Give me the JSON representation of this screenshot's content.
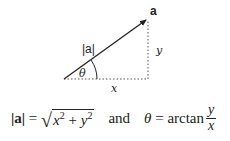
{
  "diagram": {
    "vector_label": "a",
    "magnitude_label": "|a|",
    "angle_label": "θ",
    "x_label": "x",
    "y_label": "y",
    "origin": [
      64,
      79
    ],
    "tip": [
      148,
      19
    ],
    "line_color": "#222222",
    "dotted_color": "#555555"
  },
  "formula": {
    "magnitude_lhs": "|a|",
    "equals": " = ",
    "sqrt_x": "x",
    "sqrt_exp1": "2",
    "plus": " + ",
    "sqrt_y": "y",
    "sqrt_exp2": "2",
    "and": "and",
    "theta": "θ",
    "equals2": " = ",
    "arctan": "arctan",
    "frac_num": "y",
    "frac_den": "x"
  }
}
